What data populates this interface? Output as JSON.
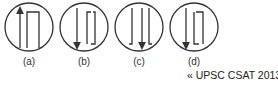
{
  "diagram": {
    "type": "answer-options",
    "options": [
      {
        "label": "(a)",
        "arrow": "up",
        "shape": "inverted U (top bracket)"
      },
      {
        "label": "(b)",
        "arrow": "down",
        "shape": "bracket open top-left, bottom-right hook"
      },
      {
        "label": "(c)",
        "arrow": "down",
        "shape": "two L-hooks bottom"
      },
      {
        "label": "(d)",
        "arrow": "down",
        "shape": "L-bracket left and 7-bracket right"
      }
    ],
    "stroke_color": "#333333"
  },
  "source": {
    "icon": "«",
    "text": "UPSC CSAT 2013"
  }
}
